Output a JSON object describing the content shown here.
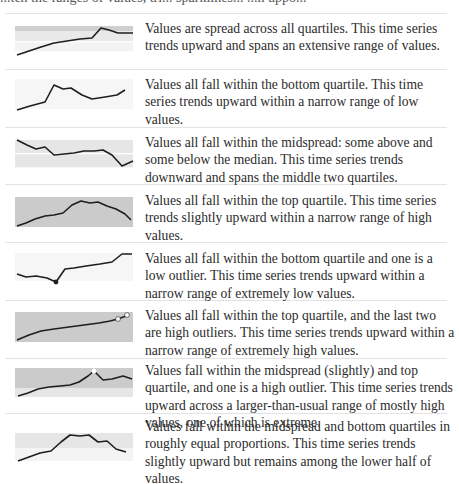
{
  "header_fragment": "...tch the ranges of values, tri... sparklines... ...h uppo...",
  "rows": [
    {
      "description": "Values are spread across all quartiles. This time series trends upward and spans an extensive range of values.",
      "bands": {
        "top": "#d3d3d3",
        "mid": "#ebebeb",
        "bottom": "#f3f3f3"
      }
    },
    {
      "description": "Values all fall within the bottom quartile. This time series trends upward within a narrow range of low values."
    },
    {
      "description": "Values all fall within the midspread: some above and some below the median. This time series trends downward and spans the middle two quartiles."
    },
    {
      "description": "Values all fall within the top quartile. This time series trends slightly upward within a narrow range of high values."
    },
    {
      "description": "Values all fall within the bottom quartile and one is a low outlier. This time series trends upward within a narrow range of extremely low values."
    },
    {
      "description": "Values all fall within the top quartile, and the last two are high outliers. This time series trends upward within a narrow range of extremely high values."
    },
    {
      "description": "Values fall within the midspread (slightly) and top quartile, and one is a high outlier. This time series trends upward across a larger-than-usual range of mostly high values, one of which is extreme."
    },
    {
      "description": "Values fall within the midspread and bottom quartiles in roughly equal proportions. This time series trends slightly upward but remains among the lower half of values."
    }
  ],
  "colors": {
    "line": "#1e1e1e",
    "band_top_quartile": "#d0d0d0",
    "band_midspread": "#e8e8e8",
    "band_bottom_quartile": "#f4f4f4",
    "median_line": "#ffffff",
    "divider": "#e3e3e3"
  }
}
